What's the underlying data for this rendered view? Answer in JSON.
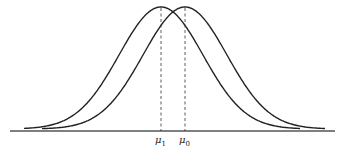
{
  "figure": {
    "curves": [
      {
        "name": "distribution-mu1",
        "mean_label": "μ1",
        "mean_x": 161
      },
      {
        "name": "distribution-mu0",
        "mean_label": "μ0",
        "mean_x": 185
      }
    ],
    "labels": {
      "mu1_symbol": "μ",
      "mu1_sub": "1",
      "mu0_symbol": "μ",
      "mu0_sub": "0"
    },
    "colors": {
      "stroke": "#222222",
      "axis": "#555555"
    }
  }
}
